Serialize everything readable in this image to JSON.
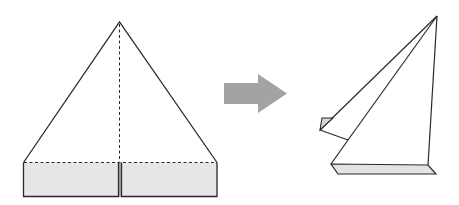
{
  "diagram": {
    "type": "origami-fold-step",
    "colors": {
      "line": "#2a2a2a",
      "fill_shaded": "#e6e6e6",
      "arrow": "#a3a3a3",
      "background": "#ffffff"
    },
    "before": {
      "label": "",
      "shape": "triangle-with-folded-band",
      "fold_line": "center-vertical-dashed",
      "band_shaded": true
    },
    "arrow": {
      "direction": "right",
      "meaning": "transforms-into"
    },
    "after": {
      "label": "",
      "shape": "folded-sailboat",
      "flap_shaded": true,
      "base_shaded": true
    }
  }
}
